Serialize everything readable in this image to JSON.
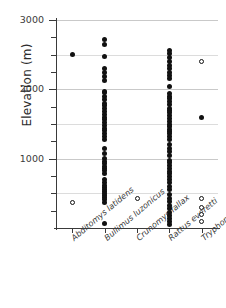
{
  "chart_data": {
    "type": "scatter",
    "title": "",
    "xlabel": "",
    "ylabel": "Elevation (m)",
    "ylim": [
      0,
      3100
    ],
    "ytick_labels": [
      "3000",
      "2000",
      "1000"
    ],
    "ytick_values": [
      3000,
      2000,
      1000
    ],
    "yminor_step": 250,
    "grid": "horizontal",
    "legend": "none",
    "marker_legend": [
      {
        "name": "filled-circle",
        "meaning": "record"
      },
      {
        "name": "open-circle",
        "meaning": "record"
      }
    ],
    "categories": [
      "Abditomys latidens",
      "Bullimus luzonicus",
      "Crunomys fallax",
      "Rattus everetti",
      "Tryphomys adustus"
    ],
    "series": [
      {
        "name": "Abditomys latidens",
        "filled": [
          2500
        ],
        "open": [
          375
        ]
      },
      {
        "name": "Bullimus luzonicus",
        "filled": [
          2725,
          2650,
          2475,
          2300,
          2250,
          2190,
          2125,
          1975,
          1950,
          1900,
          1850,
          1800,
          1760,
          1720,
          1680,
          1640,
          1600,
          1560,
          1520,
          1480,
          1440,
          1400,
          1360,
          1320,
          1280,
          1150,
          1075,
          1000,
          960,
          925,
          890,
          860,
          830,
          780,
          700,
          650,
          620,
          590,
          560,
          530,
          500,
          470,
          440,
          410,
          375,
          60
        ],
        "open": []
      },
      {
        "name": "Crunomys fallax",
        "filled": [],
        "open": [
          430
        ]
      },
      {
        "name": "Rattus everetti",
        "filled": [
          2560,
          2520,
          2460,
          2400,
          2350,
          2300,
          2250,
          2200,
          2150,
          2040,
          1940,
          1900,
          1870,
          1820,
          1780,
          1730,
          1700,
          1660,
          1620,
          1580,
          1540,
          1500,
          1460,
          1420,
          1390,
          1360,
          1320,
          1280,
          1200,
          1150,
          1100,
          1050,
          980,
          940,
          900,
          860,
          820,
          780,
          740,
          700,
          650,
          600,
          550,
          490,
          430,
          380,
          330,
          280,
          230,
          180,
          130,
          90,
          50
        ],
        "open": []
      },
      {
        "name": "Tryphomys adustus",
        "filled": [
          1600
        ],
        "open": [
          2400,
          420,
          300,
          190,
          90
        ]
      }
    ]
  }
}
